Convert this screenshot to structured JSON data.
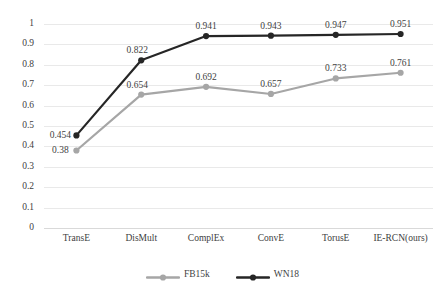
{
  "chart_data": {
    "type": "line",
    "title": "",
    "xlabel": "",
    "ylabel": "",
    "categories": [
      "TransE",
      "DisMult",
      "ComplEx",
      "ConvE",
      "TorusE",
      "IE-RCN(ours)"
    ],
    "series": [
      {
        "name": "FB15k",
        "color": "#a6a6a6",
        "values": [
          0.38,
          0.654,
          0.692,
          0.657,
          0.733,
          0.761
        ],
        "labels": [
          "0.38",
          "0.654",
          "0.692",
          "0.657",
          "0.733",
          "0.761"
        ]
      },
      {
        "name": "WN18",
        "color": "#262626",
        "values": [
          0.454,
          0.822,
          0.941,
          0.943,
          0.947,
          0.951
        ],
        "labels": [
          "0.454",
          "0.822",
          "0.941",
          "0.943",
          "0.947",
          "0.951"
        ]
      }
    ],
    "ylim": [
      0,
      1
    ],
    "ytick_step": 0.1,
    "ytick_labels": [
      "0",
      "0.1",
      "0.2",
      "0.3",
      "0.4",
      "0.5",
      "0.6",
      "0.7",
      "0.8",
      "0.9",
      "1"
    ],
    "grid": true,
    "legend_position": "bottom-center",
    "show_data_labels": true,
    "marker": "circle"
  },
  "legend": {
    "items": [
      {
        "label": "FB15k",
        "color": "#a6a6a6"
      },
      {
        "label": "WN18",
        "color": "#262626"
      }
    ]
  }
}
